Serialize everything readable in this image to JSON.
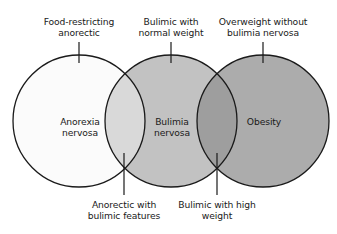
{
  "diagram": {
    "type": "venn",
    "colors": {
      "anorexia_fill": "#fbfbfb",
      "anorexia_bulimia_overlap_fill": "#d9d9d9",
      "bulimia_fill": "#c2c2c2",
      "bulimia_obesity_overlap_fill": "#9e9e9e",
      "obesity_fill": "#acacac",
      "stroke": "#1a1a1a"
    },
    "circles": [
      {
        "id": "anorexia",
        "label_line1": "Anorexia",
        "label_line2": "nervosa"
      },
      {
        "id": "bulimia",
        "label_line1": "Bulimia",
        "label_line2": "nervosa"
      },
      {
        "id": "obesity",
        "label_line1": "Obesity"
      }
    ],
    "callouts_top": [
      {
        "line1": "Food-restricting",
        "line2": "anorectic"
      },
      {
        "line1": "Bulimic with",
        "line2": "normal weight"
      },
      {
        "line1": "Overweight without",
        "line2": "bulimia nervosa"
      }
    ],
    "callouts_bottom": [
      {
        "line1": "Anorectic with",
        "line2": "bulimic features"
      },
      {
        "line1": "Bulimic with high",
        "line2": "weight"
      }
    ]
  }
}
